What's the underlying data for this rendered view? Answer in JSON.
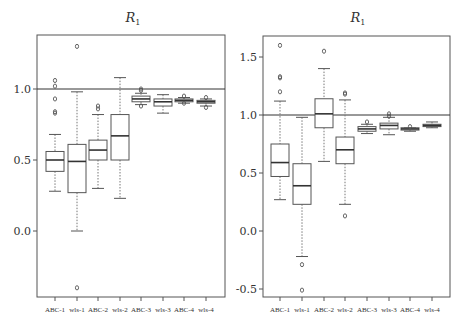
{
  "chart_data": [
    {
      "type": "box",
      "title": "R",
      "title_subscript": "1",
      "xlabel": "",
      "ylabel": "",
      "ylim": [
        -0.45,
        1.39
      ],
      "yticks": [
        0.0,
        0.5,
        1.0
      ],
      "ytick_labels": [
        "0.0",
        "0.5",
        "1.0"
      ],
      "reference_line": 1.0,
      "grid": false,
      "categories": [
        "ABC-1",
        "wls-1",
        "ABC-2",
        "wls-2",
        "ABC-3",
        "wls-3",
        "ABC-4",
        "wls-4"
      ],
      "boxes": [
        {
          "label": "ABC-1",
          "whisker_low": 0.28,
          "q1": 0.42,
          "median": 0.5,
          "q3": 0.56,
          "whisker_high": 0.68,
          "outliers": [
            1.06,
            1.02,
            0.93,
            0.84,
            0.83
          ]
        },
        {
          "label": "wls-1",
          "whisker_low": 0.0,
          "q1": 0.27,
          "median": 0.49,
          "q3": 0.61,
          "whisker_high": 0.98,
          "outliers": [
            1.3,
            -0.4
          ]
        },
        {
          "label": "ABC-2",
          "whisker_low": 0.3,
          "q1": 0.5,
          "median": 0.57,
          "q3": 0.64,
          "whisker_high": 0.82,
          "outliers": [
            0.88,
            0.86
          ]
        },
        {
          "label": "wls-2",
          "whisker_low": 0.23,
          "q1": 0.5,
          "median": 0.67,
          "q3": 0.82,
          "whisker_high": 1.08,
          "outliers": []
        },
        {
          "label": "ABC-3",
          "whisker_low": 0.89,
          "q1": 0.91,
          "median": 0.93,
          "q3": 0.95,
          "whisker_high": 0.97,
          "outliers": [
            1.0,
            0.99,
            0.88
          ]
        },
        {
          "label": "wls-3",
          "whisker_low": 0.83,
          "q1": 0.88,
          "median": 0.91,
          "q3": 0.93,
          "whisker_high": 0.96,
          "outliers": []
        },
        {
          "label": "ABC-4",
          "whisker_low": 0.9,
          "q1": 0.91,
          "median": 0.92,
          "q3": 0.93,
          "whisker_high": 0.94,
          "outliers": [
            0.95,
            0.9
          ]
        },
        {
          "label": "wls-4",
          "whisker_low": 0.88,
          "q1": 0.9,
          "median": 0.91,
          "q3": 0.92,
          "whisker_high": 0.93,
          "outliers": [
            0.94,
            0.87
          ]
        }
      ]
    },
    {
      "type": "box",
      "title": "R",
      "title_subscript": "1",
      "xlabel": "",
      "ylabel": "",
      "ylim": [
        -0.57,
        1.68
      ],
      "yticks": [
        -0.5,
        0.0,
        0.5,
        1.0,
        1.5
      ],
      "ytick_labels": [
        "-0.5",
        "0.0",
        "0.5",
        "1.0",
        "1.5"
      ],
      "reference_line": 1.0,
      "grid": false,
      "categories": [
        "ABC-1",
        "wls-1",
        "ABC-2",
        "wls-2",
        "ABC-3",
        "wls-3",
        "ABC-4",
        "wls-4"
      ],
      "boxes": [
        {
          "label": "ABC-1",
          "whisker_low": 0.27,
          "q1": 0.47,
          "median": 0.59,
          "q3": 0.75,
          "whisker_high": 1.12,
          "outliers": [
            1.6,
            1.33,
            1.32,
            1.2
          ]
        },
        {
          "label": "wls-1",
          "whisker_low": -0.22,
          "q1": 0.23,
          "median": 0.39,
          "q3": 0.58,
          "whisker_high": 0.98,
          "outliers": [
            -0.29,
            -0.51
          ]
        },
        {
          "label": "ABC-2",
          "whisker_low": 0.6,
          "q1": 0.89,
          "median": 1.01,
          "q3": 1.14,
          "whisker_high": 1.4,
          "outliers": [
            1.55
          ]
        },
        {
          "label": "wls-2",
          "whisker_low": 0.23,
          "q1": 0.58,
          "median": 0.7,
          "q3": 0.81,
          "whisker_high": 1.13,
          "outliers": [
            1.19,
            1.18,
            0.13
          ]
        },
        {
          "label": "ABC-3",
          "whisker_low": 0.84,
          "q1": 0.86,
          "median": 0.88,
          "q3": 0.9,
          "whisker_high": 0.92,
          "outliers": [
            0.94
          ]
        },
        {
          "label": "wls-3",
          "whisker_low": 0.83,
          "q1": 0.88,
          "median": 0.91,
          "q3": 0.93,
          "whisker_high": 0.98,
          "outliers": [
            1.01,
            0.99
          ]
        },
        {
          "label": "ABC-4",
          "whisker_low": 0.86,
          "q1": 0.87,
          "median": 0.88,
          "q3": 0.89,
          "whisker_high": 0.89,
          "outliers": [
            0.9
          ]
        },
        {
          "label": "wls-4",
          "whisker_low": 0.89,
          "q1": 0.9,
          "median": 0.91,
          "q3": 0.92,
          "whisker_high": 0.94,
          "outliers": []
        }
      ]
    }
  ],
  "layout": {
    "panels": [
      {
        "frame": {
          "x0": 37,
          "y0": 35,
          "x1": 225,
          "y1": 297
        },
        "y_zero_px": 231,
        "px_per_unit": 142,
        "x_ticks_px": [
          55,
          77,
          98,
          120,
          141,
          163,
          184,
          206
        ],
        "title_x": 133,
        "title_y": 22
      },
      {
        "frame": {
          "x0": 263,
          "y0": 36,
          "x1": 450,
          "y1": 297
        },
        "y_zero_px": 231,
        "px_per_unit": 116,
        "x_ticks_px": [
          280,
          302,
          324,
          345,
          367,
          389,
          410,
          432
        ],
        "title_x": 358,
        "title_y": 22
      }
    ],
    "box_half_width": 9,
    "cap_half_width": 6,
    "colors": {
      "frame": "#555555",
      "box": "#555555",
      "median": "#333333",
      "whisker": "#777777",
      "reference": "#333333",
      "text": "#333333"
    }
  }
}
